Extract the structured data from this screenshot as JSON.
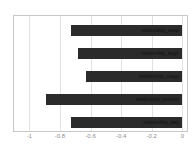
{
  "chart_data": {
    "type": "bar",
    "orientation": "horizontal",
    "title": "",
    "xlabel": "",
    "ylabel": "",
    "xlim": [
      -1.1,
      0.03
    ],
    "grid": true,
    "legend": false,
    "bar_color": "#2b2b2b",
    "background_color": "#ffffff",
    "frame_color": "#c8c8c8",
    "gridline_color": "#e2e2e2",
    "tick_label_color": "#8a8a8a",
    "xticks": [
      -1,
      -0.8,
      -0.6,
      -0.4,
      -0.2,
      0
    ],
    "xtick_labels": [
      "-1",
      "-0.8",
      "-0.6",
      "-0.4",
      "-0.2",
      "0"
    ],
    "categories": [
      "relationship_setup",
      "relationship_begin",
      "relationship_usage",
      "relationship_process",
      "relationship_step"
    ],
    "values": [
      -0.73,
      -0.68,
      -0.63,
      -0.89,
      -0.73
    ],
    "bars": [
      {
        "label": "relationship_setup",
        "value": -0.73,
        "sublabel": ""
      },
      {
        "label": "relationship_begin",
        "value": -0.68,
        "sublabel": ""
      },
      {
        "label": "relationship_usage",
        "value": -0.63,
        "sublabel": ""
      },
      {
        "label": "relationship_process",
        "value": -0.89,
        "sublabel": ""
      },
      {
        "label": "relationship_step",
        "value": -0.73,
        "sublabel": ""
      }
    ]
  }
}
